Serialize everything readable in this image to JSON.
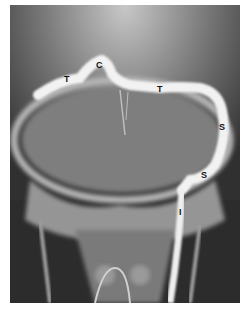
{
  "image": {
    "description": "Radiograph (X-ray) of skull base with contrast-filled dural venous sinuses",
    "labels": [
      {
        "id": "T1",
        "text": "T",
        "x": 64,
        "y": 75
      },
      {
        "id": "C",
        "text": "C",
        "x": 96,
        "y": 61
      },
      {
        "id": "T2",
        "text": "T",
        "x": 157,
        "y": 85
      },
      {
        "id": "S1",
        "text": "S",
        "x": 219,
        "y": 123
      },
      {
        "id": "S2",
        "text": "S",
        "x": 201,
        "y": 171
      },
      {
        "id": "I",
        "text": "I",
        "x": 179,
        "y": 208
      }
    ]
  }
}
